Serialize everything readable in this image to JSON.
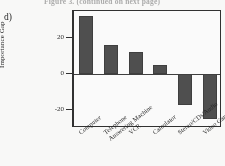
{
  "figure": {
    "panel_label": "d)",
    "top_caption": "Figure 3. (continued on next page)"
  },
  "chart_data": {
    "type": "bar",
    "title": "",
    "xlabel": "",
    "ylabel": "Importance Gap",
    "categories": [
      "Computer",
      "Telephone Answering Machine",
      "VCR",
      "Calculator",
      "Stereo/CDs/Audio",
      "Video Games"
    ],
    "category_lines": [
      [
        "Computer",
        ""
      ],
      [
        "Telephone",
        "Answering Machine"
      ],
      [
        "VCR",
        ""
      ],
      [
        "Calculator",
        ""
      ],
      [
        "Stereo/CDs/Audio",
        ""
      ],
      [
        "Video Games",
        ""
      ]
    ],
    "values": [
      32,
      16,
      12.5,
      5,
      -17,
      -25
    ],
    "ylim": [
      -30,
      35
    ],
    "yticks": [
      20,
      0,
      -20
    ],
    "ytick_labels": [
      "20",
      "0",
      "-20"
    ],
    "grid": false,
    "legend": "none",
    "bar_color": "#4b4b4b",
    "axis_color": "#2b2b2b"
  }
}
